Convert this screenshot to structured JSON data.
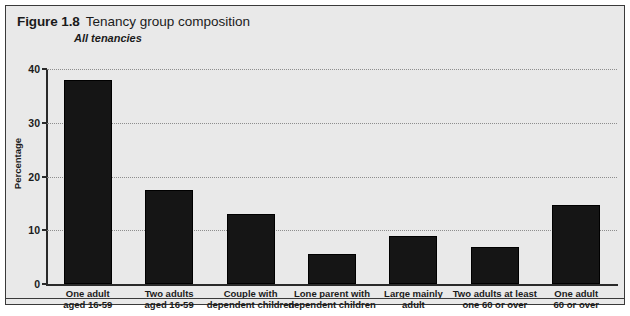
{
  "figure": {
    "number": "Figure 1.8",
    "title": "Tenancy group composition",
    "subtitle": "All tenancies"
  },
  "chart_data": {
    "type": "bar",
    "title": "Tenancy group composition",
    "subtitle": "All tenancies",
    "xlabel": "",
    "ylabel": "Percentage",
    "ylim": [
      0,
      40
    ],
    "yticks": [
      0,
      10,
      20,
      30,
      40
    ],
    "grid": true,
    "legend": false,
    "bar_color": "#151515",
    "categories": [
      "One adult\naged 16-59",
      "Two adults\naged 16-59",
      "Couple with\ndependent children",
      "Lone parent with\ndependent children",
      "Large mainly\nadult",
      "Two adults at least\none 60 or over",
      "One adult\n60 or over"
    ],
    "category_lines": [
      [
        "One adult",
        "aged 16-59"
      ],
      [
        "Two adults",
        "aged 16-59"
      ],
      [
        "Couple with",
        "dependent children"
      ],
      [
        "Lone parent with",
        "dependent children"
      ],
      [
        "Large mainly",
        "adult"
      ],
      [
        "Two adults at least",
        "one 60 or over"
      ],
      [
        "One adult",
        "60 or over"
      ]
    ],
    "values": [
      38,
      17.5,
      13,
      5.5,
      9,
      6.8,
      14.7
    ]
  },
  "axis": {
    "tick_labels": [
      "0",
      "10",
      "20",
      "30",
      "40"
    ],
    "y_title": "Percentage"
  }
}
